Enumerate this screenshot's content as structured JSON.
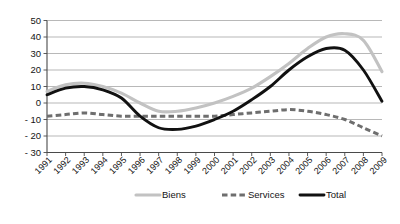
{
  "chart_data": {
    "type": "line",
    "title": "",
    "subtitle": "",
    "xlabel": "",
    "ylabel": "",
    "x": [
      1991,
      1992,
      1993,
      1994,
      1995,
      1996,
      1997,
      1998,
      1999,
      2000,
      2001,
      2002,
      2003,
      2004,
      2005,
      2006,
      2007,
      2008,
      2009
    ],
    "categories": [
      "1991",
      "1992",
      "1993",
      "1994",
      "1995",
      "1996",
      "1997",
      "1998",
      "1999",
      "2000",
      "2001",
      "2002",
      "2003",
      "2004",
      "2005",
      "2006",
      "2007",
      "2008",
      "2009"
    ],
    "ylim": [
      -30,
      50
    ],
    "ytick_values": [
      50,
      40,
      30,
      20,
      10,
      0,
      -10,
      -20,
      -30
    ],
    "ytick_labels": [
      "50",
      "40",
      "30",
      "20",
      "10",
      "0",
      "- 10",
      "- 20",
      "- 30"
    ],
    "grid": true,
    "legend_position": "bottom",
    "series": [
      {
        "name": "Biens",
        "color": "#c2c2c2",
        "style": "solid",
        "values": [
          7,
          11,
          12,
          10,
          6,
          0,
          -5,
          -5,
          -3,
          0,
          4,
          9,
          16,
          24,
          33,
          40,
          42,
          38,
          19
        ]
      },
      {
        "name": "Services",
        "color": "#6e6e6e",
        "style": "dashed",
        "values": [
          -8,
          -7,
          -6,
          -7,
          -8,
          -8,
          -8,
          -8,
          -8,
          -8,
          -7,
          -6,
          -5,
          -4,
          -5,
          -7,
          -10,
          -15,
          -20
        ]
      },
      {
        "name": "Total",
        "color": "#111111",
        "style": "solid",
        "values": [
          5,
          9,
          10,
          8,
          3,
          -8,
          -15,
          -16,
          -14,
          -10,
          -5,
          2,
          10,
          20,
          28,
          33,
          32,
          20,
          1
        ]
      }
    ]
  },
  "legend": {
    "items": [
      {
        "label": "Biens",
        "marker": "solid-line-light-gray"
      },
      {
        "label": "Services",
        "marker": "dashed-line-dark-gray"
      },
      {
        "label": "Total",
        "marker": "solid-line-black"
      }
    ]
  },
  "colors": {
    "biens": "#c2c2c2",
    "services": "#6e6e6e",
    "total": "#111111",
    "grid": "#9a9a9a",
    "axis": "#4a4a4a",
    "background": "#ffffff",
    "text": "#141414"
  }
}
